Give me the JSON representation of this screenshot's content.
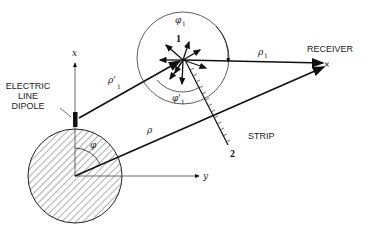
{
  "figure": {
    "labels": {
      "x_axis": "x",
      "y_axis": "y",
      "dipole_line1": "ELECTRIC",
      "dipole_line2": "LINE",
      "dipole_line3": "DIPOLE",
      "receiver": "RECEIVER",
      "receiver_mark": "×",
      "strip": "STRIP",
      "edge1": "1",
      "edge2": "2",
      "rho": "ρ",
      "rho_prime": "ρ'",
      "rho_prime_sub": "1",
      "rho1": "ρ",
      "rho1_sub": "1",
      "phi": "φ",
      "phi1": "φ",
      "phi1_sub": "1",
      "phi_prime1": "φ'",
      "phi_prime1_sub": "1"
    },
    "colors": {
      "ink": "#111111",
      "background": "#ffffff"
    }
  }
}
